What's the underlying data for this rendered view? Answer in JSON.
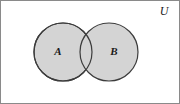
{
  "figure": {
    "kind": "venn-diagram",
    "width": 180,
    "height": 104,
    "background_color": "#ffffff",
    "frame": {
      "name": "universe-rectangle",
      "border_color": "#8a8a8a",
      "border_width": 1,
      "fill": "#ffffff"
    },
    "universe": {
      "label": "U",
      "x": 163,
      "y": 14,
      "style": "italic-serif"
    },
    "sets": [
      {
        "id": "A",
        "label": "A",
        "cx": 62,
        "cy": 51,
        "r": 29,
        "fill_color": "#d4d4d4",
        "stroke_color": "#3c3c3c",
        "stroke_width": 1.2,
        "label_x": 57,
        "label_y": 54
      },
      {
        "id": "B",
        "label": "B",
        "cx": 108,
        "cy": 51,
        "r": 29,
        "fill_color": "#d4d4d4",
        "stroke_color": "#3c3c3c",
        "stroke_width": 1.2,
        "label_x": 113,
        "label_y": 54
      }
    ],
    "intersection": {
      "name": "a-intersect-b",
      "fill_color": "#d4d4d4",
      "x_range": [
        79,
        91
      ]
    }
  }
}
